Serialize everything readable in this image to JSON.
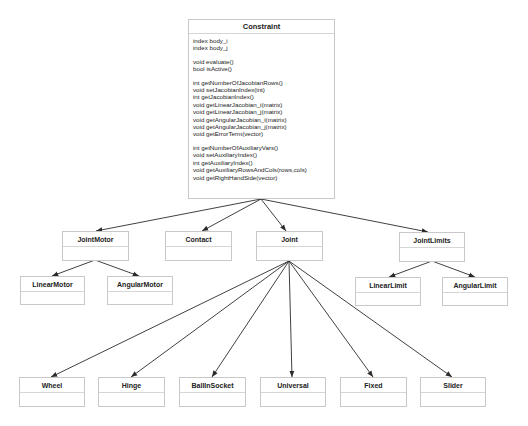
{
  "diagram": {
    "type": "uml-class-hierarchy",
    "root": {
      "name": "Constraint",
      "attributes": [
        "index body_i",
        "index body_j"
      ],
      "method_groups": [
        [
          "void evaluate()",
          "bool isActive()"
        ],
        [
          "int getNumberOfJacobianRows()",
          "void setJacobianIndex(int)",
          "int getJacobianIndex()",
          "void getLinearJacobian_i(matrix)",
          "void getLinearJacobian_j(matrix)",
          "void getAngularJacobian_i(matrix)",
          "void getAngularJacobian_j(matrix)",
          "void getErrorTerm(vector)"
        ],
        [
          "int getNumberOfAuxiliaryVars()",
          "void setAuxiliaryIndex()",
          "int getAuxiliaryIndex()",
          "void getAuxiliaryRowsAndCols(rows,cols)",
          "void getRightHandSide(vector)"
        ]
      ]
    },
    "level1": [
      {
        "name": "JointMotor"
      },
      {
        "name": "Contact"
      },
      {
        "name": "Joint"
      },
      {
        "name": "JointLimits"
      }
    ],
    "jointmotor_children": [
      {
        "name": "LinearMotor"
      },
      {
        "name": "AngularMotor"
      }
    ],
    "jointlimits_children": [
      {
        "name": "LinearLimit"
      },
      {
        "name": "AngularLimit"
      }
    ],
    "joint_children": [
      {
        "name": "Wheel"
      },
      {
        "name": "Hinge"
      },
      {
        "name": "BallInSocket"
      },
      {
        "name": "Universal"
      },
      {
        "name": "Fixed"
      },
      {
        "name": "Slider"
      }
    ],
    "edges": [
      [
        "JointMotor",
        "Constraint"
      ],
      [
        "Contact",
        "Constraint"
      ],
      [
        "Joint",
        "Constraint"
      ],
      [
        "JointLimits",
        "Constraint"
      ],
      [
        "LinearMotor",
        "JointMotor"
      ],
      [
        "AngularMotor",
        "JointMotor"
      ],
      [
        "LinearLimit",
        "JointLimits"
      ],
      [
        "AngularLimit",
        "JointLimits"
      ],
      [
        "Wheel",
        "Joint"
      ],
      [
        "Hinge",
        "Joint"
      ],
      [
        "BallInSocket",
        "Joint"
      ],
      [
        "Universal",
        "Joint"
      ],
      [
        "Fixed",
        "Joint"
      ],
      [
        "Slider",
        "Joint"
      ]
    ],
    "colors": {
      "line": "#2b2b2b",
      "box_border": "#c8c8c8",
      "background": "#ffffff"
    }
  }
}
